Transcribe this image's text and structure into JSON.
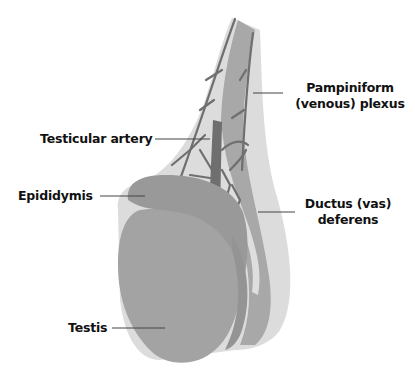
{
  "diagram": {
    "type": "anatomical-illustration",
    "colors": {
      "outer_tunic": "#d9d9d9",
      "tissue": "#a6a6a6",
      "vessel": "#6f6f6f",
      "background": "#ffffff",
      "label_text": "#111111",
      "leader_line": "#444444"
    },
    "labels": {
      "pampiniform": {
        "line1": "Pampiniform",
        "line2": "(venous) plexus"
      },
      "testicular_artery": "Testicular artery",
      "epididymis": "Epididymis",
      "ductus": {
        "line1": "Ductus (vas)",
        "line2": "deferens"
      },
      "testis": "Testis"
    }
  }
}
